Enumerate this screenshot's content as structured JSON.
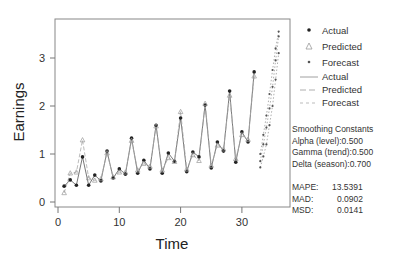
{
  "chart_data": {
    "type": "line",
    "title": "",
    "xlabel": "Time",
    "ylabel": "Earnings",
    "xlim": [
      -1,
      37.5
    ],
    "ylim": [
      -0.1,
      3.8
    ],
    "xticks": [
      0,
      10,
      20,
      30
    ],
    "yticks": [
      0,
      1,
      2,
      3
    ],
    "grid": false,
    "legend_position": "right",
    "series": [
      {
        "name": "Actual",
        "marker": "filled-dot",
        "line": "solid",
        "x": [
          1,
          2,
          3,
          4,
          5,
          6,
          7,
          8,
          9,
          10,
          11,
          12,
          13,
          14,
          15,
          16,
          17,
          18,
          19,
          20,
          21,
          22,
          23,
          24,
          25,
          26,
          27,
          28,
          29,
          30,
          31,
          32
        ],
        "values": [
          0.33,
          0.46,
          0.35,
          0.94,
          0.35,
          0.56,
          0.44,
          1.06,
          0.5,
          0.69,
          0.58,
          1.33,
          0.6,
          0.87,
          0.69,
          1.6,
          0.6,
          1.02,
          0.85,
          1.75,
          0.63,
          1.04,
          0.94,
          2.02,
          0.71,
          1.25,
          1.06,
          2.31,
          0.83,
          1.46,
          1.25,
          2.71
        ]
      },
      {
        "name": "Predicted",
        "marker": "open-triangle",
        "line": "dashed",
        "x": [
          1,
          2,
          3,
          4,
          5,
          6,
          7,
          8,
          9,
          10,
          11,
          12,
          13,
          14,
          15,
          16,
          17,
          18,
          19,
          20,
          21,
          22,
          23,
          24,
          25,
          26,
          27,
          28,
          29,
          30,
          31,
          32
        ],
        "values": [
          0.19,
          0.6,
          0.62,
          1.29,
          0.5,
          0.45,
          0.48,
          1.02,
          0.52,
          0.62,
          0.62,
          1.28,
          0.66,
          0.8,
          0.74,
          1.58,
          0.66,
          0.92,
          0.84,
          1.88,
          0.68,
          0.98,
          0.86,
          2.05,
          0.76,
          1.18,
          1.1,
          2.22,
          0.9,
          1.4,
          1.3,
          2.62
        ]
      },
      {
        "name": "Forecast",
        "marker": "small-dot",
        "line": "dotted",
        "x": [
          33,
          33.5,
          34,
          34.5,
          35,
          35.5,
          36
        ],
        "values": [
          0.85,
          1.2,
          1.55,
          1.95,
          2.4,
          2.95,
          3.45
        ]
      },
      {
        "name": "Forecast lower",
        "marker": "small-dot",
        "line": "dotted",
        "x": [
          33,
          33.5,
          34,
          34.5,
          35,
          35.5,
          36
        ],
        "values": [
          0.72,
          0.95,
          1.2,
          1.6,
          2.0,
          2.55,
          3.1
        ]
      },
      {
        "name": "Forecast upper",
        "marker": "small-dot",
        "line": "dotted",
        "x": [
          33,
          33.5,
          34,
          34.5,
          35,
          35.5,
          36
        ],
        "values": [
          1.0,
          1.4,
          1.8,
          2.25,
          2.75,
          3.2,
          3.55
        ]
      }
    ]
  },
  "legend": {
    "items": [
      {
        "label": "Actual",
        "kind": "marker-dot"
      },
      {
        "label": "Predicted",
        "kind": "marker-triangle"
      },
      {
        "label": "Forecast",
        "kind": "marker-small"
      },
      {
        "label": "Actual",
        "kind": "line-solid"
      },
      {
        "label": "Predicted",
        "kind": "line-dashed"
      },
      {
        "label": "Forecast",
        "kind": "line-dotted"
      }
    ]
  },
  "stats": {
    "heading": "Smoothing Constants",
    "alpha": "Alpha (level):0.500",
    "gamma": "Gamma (trend):0.500",
    "delta": "Delta (season):0.700",
    "mape_key": "MAPE:",
    "mape_val": "13.5391",
    "mad_key": "MAD:",
    "mad_val": "0.0902",
    "msd_key": "MSD:",
    "msd_val": "0.0141"
  },
  "colors": {
    "actual": "#222222",
    "predicted": "#888888",
    "forecast": "#444444",
    "frame": "#777777"
  }
}
